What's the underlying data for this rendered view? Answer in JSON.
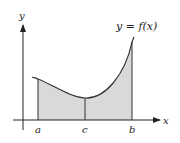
{
  "diagram": {
    "title_label": "y = f(x)",
    "axes": {
      "x_label": "x",
      "y_label": "y"
    },
    "points": [
      {
        "name": "a",
        "label": "a"
      },
      {
        "name": "c",
        "label": "c"
      },
      {
        "name": "b",
        "label": "b"
      }
    ],
    "colors": {
      "fill": "#d9d9d9",
      "stroke": "#333333",
      "axis": "#222222"
    }
  }
}
